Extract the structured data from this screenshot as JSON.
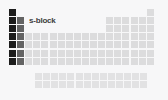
{
  "diagram": {
    "type": "periodic-table-block-highlight",
    "title": "s-block",
    "background_color": "#f7f7f8",
    "legend": {
      "label": "s-block",
      "x": 29,
      "y": 16,
      "color": "#3d3d3d"
    },
    "grid": {
      "cell_size": 7,
      "cell_pitch": 8.1,
      "origin_x": 9,
      "origin_y": 9,
      "columns": 18,
      "periods": 7,
      "fblock_offset_x": 35,
      "fblock_origin_y": 73,
      "fblock_columns": 14,
      "fblock_rows": 2
    },
    "colors": {
      "s_block_group1": "#1c1c1c",
      "s_block_group2": "#636363",
      "other_blocks": "#dcdcdd",
      "fblock": "#e2e2e3"
    },
    "blocks": [
      {
        "name": "s-block group 1",
        "color": "#1c1c1c",
        "highlighted": true,
        "cells": [
          {
            "col": 1,
            "row": 1
          },
          {
            "col": 1,
            "row": 2
          },
          {
            "col": 1,
            "row": 3
          },
          {
            "col": 1,
            "row": 4
          },
          {
            "col": 1,
            "row": 5
          },
          {
            "col": 1,
            "row": 6
          },
          {
            "col": 1,
            "row": 7
          }
        ]
      },
      {
        "name": "s-block group 2",
        "color": "#636363",
        "highlighted": true,
        "cells": [
          {
            "col": 2,
            "row": 2
          },
          {
            "col": 2,
            "row": 3
          },
          {
            "col": 2,
            "row": 4
          },
          {
            "col": 2,
            "row": 5
          },
          {
            "col": 2,
            "row": 6
          },
          {
            "col": 2,
            "row": 7
          }
        ]
      },
      {
        "name": "p-block",
        "color": "#dcdcdd",
        "highlighted": false,
        "cells": [
          {
            "col": 18,
            "row": 1
          },
          {
            "col": 13,
            "row": 2
          },
          {
            "col": 14,
            "row": 2
          },
          {
            "col": 15,
            "row": 2
          },
          {
            "col": 16,
            "row": 2
          },
          {
            "col": 17,
            "row": 2
          },
          {
            "col": 18,
            "row": 2
          },
          {
            "col": 13,
            "row": 3
          },
          {
            "col": 14,
            "row": 3
          },
          {
            "col": 15,
            "row": 3
          },
          {
            "col": 16,
            "row": 3
          },
          {
            "col": 17,
            "row": 3
          },
          {
            "col": 18,
            "row": 3
          },
          {
            "col": 13,
            "row": 4
          },
          {
            "col": 14,
            "row": 4
          },
          {
            "col": 15,
            "row": 4
          },
          {
            "col": 16,
            "row": 4
          },
          {
            "col": 17,
            "row": 4
          },
          {
            "col": 18,
            "row": 4
          },
          {
            "col": 13,
            "row": 5
          },
          {
            "col": 14,
            "row": 5
          },
          {
            "col": 15,
            "row": 5
          },
          {
            "col": 16,
            "row": 5
          },
          {
            "col": 17,
            "row": 5
          },
          {
            "col": 18,
            "row": 5
          },
          {
            "col": 13,
            "row": 6
          },
          {
            "col": 14,
            "row": 6
          },
          {
            "col": 15,
            "row": 6
          },
          {
            "col": 16,
            "row": 6
          },
          {
            "col": 17,
            "row": 6
          },
          {
            "col": 18,
            "row": 6
          },
          {
            "col": 13,
            "row": 7
          },
          {
            "col": 14,
            "row": 7
          },
          {
            "col": 15,
            "row": 7
          },
          {
            "col": 16,
            "row": 7
          },
          {
            "col": 17,
            "row": 7
          },
          {
            "col": 18,
            "row": 7
          }
        ]
      },
      {
        "name": "d-block",
        "color": "#dcdcdd",
        "highlighted": false,
        "cells": [
          {
            "col": 3,
            "row": 4
          },
          {
            "col": 4,
            "row": 4
          },
          {
            "col": 5,
            "row": 4
          },
          {
            "col": 6,
            "row": 4
          },
          {
            "col": 7,
            "row": 4
          },
          {
            "col": 8,
            "row": 4
          },
          {
            "col": 9,
            "row": 4
          },
          {
            "col": 10,
            "row": 4
          },
          {
            "col": 11,
            "row": 4
          },
          {
            "col": 12,
            "row": 4
          },
          {
            "col": 3,
            "row": 5
          },
          {
            "col": 4,
            "row": 5
          },
          {
            "col": 5,
            "row": 5
          },
          {
            "col": 6,
            "row": 5
          },
          {
            "col": 7,
            "row": 5
          },
          {
            "col": 8,
            "row": 5
          },
          {
            "col": 9,
            "row": 5
          },
          {
            "col": 10,
            "row": 5
          },
          {
            "col": 11,
            "row": 5
          },
          {
            "col": 12,
            "row": 5
          },
          {
            "col": 3,
            "row": 6
          },
          {
            "col": 4,
            "row": 6
          },
          {
            "col": 5,
            "row": 6
          },
          {
            "col": 6,
            "row": 6
          },
          {
            "col": 7,
            "row": 6
          },
          {
            "col": 8,
            "row": 6
          },
          {
            "col": 9,
            "row": 6
          },
          {
            "col": 10,
            "row": 6
          },
          {
            "col": 11,
            "row": 6
          },
          {
            "col": 12,
            "row": 6
          },
          {
            "col": 3,
            "row": 7
          },
          {
            "col": 4,
            "row": 7
          },
          {
            "col": 5,
            "row": 7
          },
          {
            "col": 6,
            "row": 7
          },
          {
            "col": 7,
            "row": 7
          },
          {
            "col": 8,
            "row": 7
          },
          {
            "col": 9,
            "row": 7
          },
          {
            "col": 10,
            "row": 7
          },
          {
            "col": 11,
            "row": 7
          },
          {
            "col": 12,
            "row": 7
          }
        ]
      },
      {
        "name": "f-block",
        "color": "#e2e2e3",
        "highlighted": false,
        "detached": true,
        "cells": [
          {
            "col": 1,
            "row": 1
          },
          {
            "col": 2,
            "row": 1
          },
          {
            "col": 3,
            "row": 1
          },
          {
            "col": 4,
            "row": 1
          },
          {
            "col": 5,
            "row": 1
          },
          {
            "col": 6,
            "row": 1
          },
          {
            "col": 7,
            "row": 1
          },
          {
            "col": 8,
            "row": 1
          },
          {
            "col": 9,
            "row": 1
          },
          {
            "col": 10,
            "row": 1
          },
          {
            "col": 11,
            "row": 1
          },
          {
            "col": 12,
            "row": 1
          },
          {
            "col": 13,
            "row": 1
          },
          {
            "col": 14,
            "row": 1
          },
          {
            "col": 1,
            "row": 2
          },
          {
            "col": 2,
            "row": 2
          },
          {
            "col": 3,
            "row": 2
          },
          {
            "col": 4,
            "row": 2
          },
          {
            "col": 5,
            "row": 2
          },
          {
            "col": 6,
            "row": 2
          },
          {
            "col": 7,
            "row": 2
          },
          {
            "col": 8,
            "row": 2
          },
          {
            "col": 9,
            "row": 2
          },
          {
            "col": 10,
            "row": 2
          },
          {
            "col": 11,
            "row": 2
          },
          {
            "col": 12,
            "row": 2
          },
          {
            "col": 13,
            "row": 2
          },
          {
            "col": 14,
            "row": 2
          }
        ]
      }
    ]
  }
}
